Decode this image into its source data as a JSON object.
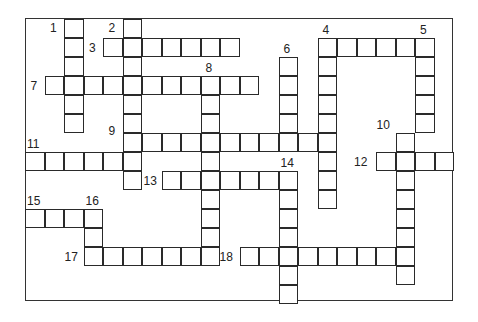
{
  "puzzle": {
    "grid": {
      "origin_x": 25,
      "origin_y": 18.5,
      "cell_w": 19.5,
      "cell_h": 19
    },
    "words": [
      {
        "number": "1",
        "dir": "down",
        "col": 2,
        "row": 0,
        "len": 6,
        "label_dx": -14,
        "label_dy": 3
      },
      {
        "number": "2",
        "dir": "down",
        "col": 5,
        "row": 0,
        "len": 9,
        "label_dx": -14,
        "label_dy": 3
      },
      {
        "number": "3",
        "dir": "across",
        "col": 4,
        "row": 1,
        "len": 7,
        "label_dx": -14,
        "label_dy": 4
      },
      {
        "number": "4",
        "dir": "across",
        "col": 15,
        "row": 1,
        "len": 6,
        "label_dx": 5,
        "label_dy": -14
      },
      {
        "number": "4",
        "dir": "down",
        "col": 15,
        "row": 1,
        "len": 9,
        "label_dx": null,
        "label_dy": null
      },
      {
        "number": "5",
        "dir": "down",
        "col": 20,
        "row": 1,
        "len": 5,
        "label_dx": 5,
        "label_dy": -14
      },
      {
        "number": "6",
        "dir": "down",
        "col": 13,
        "row": 2,
        "len": 5,
        "label_dx": 5,
        "label_dy": -14
      },
      {
        "number": "7",
        "dir": "across",
        "col": 1,
        "row": 3,
        "len": 11,
        "label_dx": -14,
        "label_dy": 4
      },
      {
        "number": "8",
        "dir": "down",
        "col": 9,
        "row": 3,
        "len": 10,
        "label_dx": 5,
        "label_dy": -14
      },
      {
        "number": "9",
        "dir": "across",
        "col": 5,
        "row": 6,
        "len": 11,
        "label_dx": -14,
        "label_dy": -8
      },
      {
        "number": "10",
        "dir": "down",
        "col": 19,
        "row": 6,
        "len": 8,
        "label_dx": -19,
        "label_dy": -14
      },
      {
        "number": "11",
        "dir": "across",
        "col": 0,
        "row": 7,
        "len": 6,
        "label_dx": 2,
        "label_dy": -14
      },
      {
        "number": "12",
        "dir": "across",
        "col": 18,
        "row": 7,
        "len": 4,
        "label_dx": -22,
        "label_dy": 4
      },
      {
        "number": "13",
        "dir": "across",
        "col": 7,
        "row": 8,
        "len": 7,
        "label_dx": -18,
        "label_dy": 4
      },
      {
        "number": "14",
        "dir": "down",
        "col": 13,
        "row": 8,
        "len": 7,
        "label_dx": 2,
        "label_dy": -14
      },
      {
        "number": "15",
        "dir": "across",
        "col": 0,
        "row": 10,
        "len": 4,
        "label_dx": 2,
        "label_dy": -14
      },
      {
        "number": "16",
        "dir": "down",
        "col": 3,
        "row": 10,
        "len": 3,
        "label_dx": 2,
        "label_dy": -14
      },
      {
        "number": "17",
        "dir": "across",
        "col": 3,
        "row": 12,
        "len": 7,
        "label_dx": -19,
        "label_dy": 4
      },
      {
        "number": "18",
        "dir": "across",
        "col": 11,
        "row": 12,
        "len": 9,
        "label_dx": -20,
        "label_dy": 4
      }
    ]
  }
}
